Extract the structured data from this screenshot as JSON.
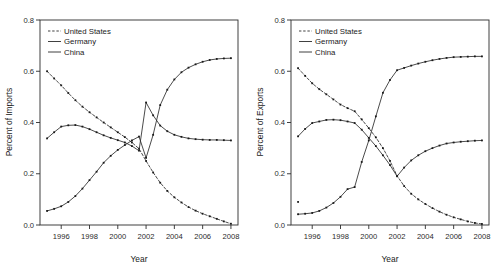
{
  "figure": {
    "panel_count": 2,
    "background_color": "#ffffff",
    "line_color": "#2b2b2b",
    "text_color": "#1a1a1a"
  },
  "chart_data": [
    {
      "type": "line",
      "panel": "left",
      "title": "",
      "xlabel": "Year",
      "ylabel": "Percent of Imports",
      "xlim": [
        1994.5,
        2008.5
      ],
      "ylim": [
        0.0,
        0.8
      ],
      "xticks": [
        1996,
        1998,
        2000,
        2002,
        2004,
        2006,
        2008
      ],
      "xticklabels": [
        "1996",
        "1998",
        "2000",
        "2002",
        "2004",
        "2006",
        "2008"
      ],
      "yticks": [
        0.0,
        0.2,
        0.4,
        0.6,
        0.8
      ],
      "yticklabels": [
        "0.0",
        "0.2",
        "0.4",
        "0.6",
        "0.8"
      ],
      "grid": false,
      "legend_position": "top-left",
      "x": [
        1995,
        1995.5,
        1996,
        1996.5,
        1997,
        1997.5,
        1998,
        1998.5,
        1999,
        1999.5,
        2000,
        2000.5,
        2001,
        2001.5,
        2002,
        2002.5,
        2003,
        2003.5,
        2004,
        2004.5,
        2005,
        2005.5,
        2006,
        2006.5,
        2007,
        2007.5,
        2008
      ],
      "series": [
        {
          "name": "United States",
          "style": "dashed",
          "values": [
            0.6,
            0.572,
            0.545,
            0.515,
            0.487,
            0.462,
            0.44,
            0.42,
            0.4,
            0.381,
            0.362,
            0.343,
            0.322,
            0.298,
            0.25,
            0.205,
            0.165,
            0.133,
            0.108,
            0.088,
            0.07,
            0.056,
            0.044,
            0.034,
            0.024,
            0.014,
            0.005
          ]
        },
        {
          "name": "Germany",
          "style": "solid",
          "values": [
            0.338,
            0.362,
            0.384,
            0.389,
            0.39,
            0.384,
            0.374,
            0.362,
            0.35,
            0.34,
            0.331,
            0.322,
            0.308,
            0.29,
            0.478,
            0.428,
            0.388,
            0.366,
            0.352,
            0.344,
            0.338,
            0.335,
            0.333,
            0.332,
            0.332,
            0.331,
            0.33
          ]
        },
        {
          "name": "China",
          "style": "solid",
          "values": [
            0.055,
            0.063,
            0.073,
            0.09,
            0.113,
            0.142,
            0.175,
            0.208,
            0.243,
            0.27,
            0.293,
            0.312,
            0.33,
            0.345,
            0.262,
            0.352,
            0.468,
            0.528,
            0.568,
            0.596,
            0.614,
            0.627,
            0.637,
            0.644,
            0.648,
            0.65,
            0.651
          ]
        }
      ]
    },
    {
      "type": "line",
      "panel": "right",
      "title": "",
      "xlabel": "Year",
      "ylabel": "Percent of Exports",
      "xlim": [
        1994.5,
        2008.5
      ],
      "ylim": [
        0.0,
        0.8
      ],
      "xticks": [
        1996,
        1998,
        2000,
        2002,
        2004,
        2006,
        2008
      ],
      "xticklabels": [
        "1996",
        "1998",
        "2000",
        "2002",
        "2004",
        "2006",
        "2008"
      ],
      "yticks": [
        0.0,
        0.2,
        0.4,
        0.6,
        0.8
      ],
      "yticklabels": [
        "0.0",
        "0.2",
        "0.4",
        "0.6",
        "0.8"
      ],
      "grid": false,
      "legend_position": "top-left",
      "x": [
        1995,
        1995.5,
        1996,
        1996.5,
        1997,
        1997.5,
        1998,
        1998.5,
        1999,
        1999.5,
        2000,
        2000.5,
        2001,
        2001.5,
        2002,
        2002.5,
        2003,
        2003.5,
        2004,
        2004.5,
        2005,
        2005.5,
        2006,
        2006.5,
        2007,
        2007.5,
        2008
      ],
      "series": [
        {
          "name": "United States",
          "style": "dashed",
          "values": [
            0.612,
            0.582,
            0.553,
            0.53,
            0.51,
            0.49,
            0.47,
            0.456,
            0.444,
            0.412,
            0.378,
            0.342,
            0.3,
            0.25,
            0.192,
            0.152,
            0.122,
            0.1,
            0.082,
            0.066,
            0.052,
            0.04,
            0.03,
            0.022,
            0.014,
            0.008,
            0.004
          ]
        },
        {
          "name": "Germany",
          "style": "solid",
          "values": [
            0.346,
            0.375,
            0.398,
            0.404,
            0.41,
            0.411,
            0.409,
            0.404,
            0.398,
            0.372,
            0.34,
            0.308,
            0.272,
            0.234,
            0.19,
            0.224,
            0.252,
            0.272,
            0.288,
            0.3,
            0.31,
            0.318,
            0.322,
            0.325,
            0.327,
            0.329,
            0.33
          ]
        },
        {
          "name": "China",
          "style": "solid",
          "values": [
            0.042,
            0.044,
            0.047,
            0.055,
            0.068,
            0.086,
            0.11,
            0.14,
            0.148,
            0.246,
            0.33,
            0.424,
            0.516,
            0.566,
            0.604,
            0.613,
            0.622,
            0.63,
            0.637,
            0.643,
            0.648,
            0.652,
            0.655,
            0.656,
            0.657,
            0.658,
            0.658
          ]
        }
      ],
      "annotations": [
        {
          "label": "isolated-point",
          "x": 1995,
          "y": 0.09,
          "series": "United States"
        }
      ]
    }
  ],
  "legend": {
    "entries": [
      {
        "label": "United States",
        "style": "dashed"
      },
      {
        "label": "Germany",
        "style": "solid"
      },
      {
        "label": "China",
        "style": "solid"
      }
    ]
  }
}
